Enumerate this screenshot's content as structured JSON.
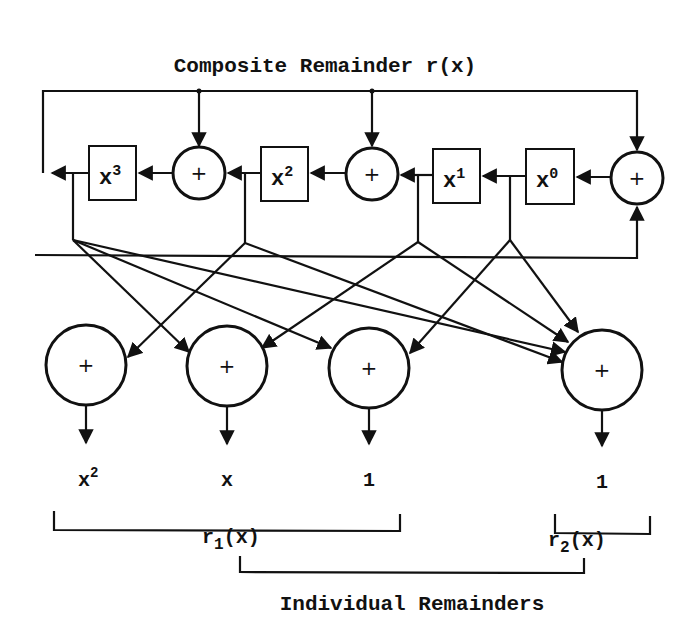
{
  "title": "Composite Remainder r(x)",
  "registers": [
    {
      "base": "x",
      "exp": "3"
    },
    {
      "base": "x",
      "exp": "2"
    },
    {
      "base": "x",
      "exp": "1"
    },
    {
      "base": "x",
      "exp": "0"
    }
  ],
  "adder_symbol": "+",
  "outputs": [
    {
      "base": "x",
      "exp": "2"
    },
    {
      "base": "x",
      "exp": ""
    },
    {
      "base": "1",
      "exp": ""
    },
    {
      "base": "1",
      "exp": ""
    }
  ],
  "groups": [
    {
      "base": "r",
      "sub": "1",
      "tail": "(x)"
    },
    {
      "base": "r",
      "sub": "2",
      "tail": "(x)"
    }
  ],
  "footer": "Individual Remainders",
  "colors": {
    "ink": "#111111",
    "background": "#ffffff"
  }
}
